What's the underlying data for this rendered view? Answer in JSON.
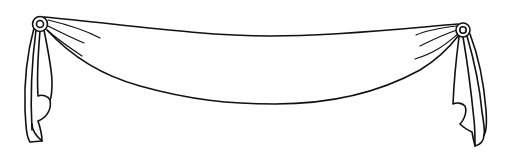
{
  "illustration": {
    "subject": "swag drape banner with rosettes and hanging tails",
    "style": "black line art on white",
    "colors": {
      "background": "#ffffff",
      "stroke": "#111111"
    },
    "elements": [
      {
        "name": "left-rosette",
        "cx": 40,
        "cy": 24
      },
      {
        "name": "right-rosette",
        "cx": 463,
        "cy": 30
      },
      {
        "name": "swag-body"
      },
      {
        "name": "left-tail"
      },
      {
        "name": "right-tail"
      }
    ]
  }
}
